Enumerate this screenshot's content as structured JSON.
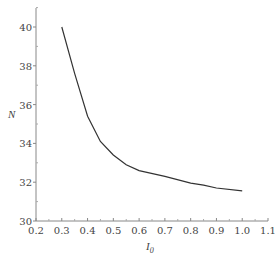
{
  "chart_data": {
    "type": "line",
    "title": "",
    "xlabel": "I0",
    "xlabel_main": "I",
    "xlabel_sub": "0",
    "ylabel": "N",
    "xlim": [
      0.2,
      1.1
    ],
    "ylim": [
      30,
      41
    ],
    "x_ticks": [
      "0.2",
      "0.3",
      "0.4",
      "0.5",
      "0.6",
      "0.7",
      "0.8",
      "0.9",
      "1.0",
      "1.1"
    ],
    "y_ticks": [
      "30",
      "32",
      "34",
      "36",
      "38",
      "40"
    ],
    "grid": false,
    "legend": null,
    "series": [
      {
        "name": "N vs I0",
        "x": [
          0.3,
          0.35,
          0.4,
          0.45,
          0.5,
          0.55,
          0.6,
          0.7,
          0.8,
          0.85,
          0.9,
          1.0
        ],
        "values": [
          40.0,
          37.6,
          35.4,
          34.1,
          33.4,
          32.9,
          32.6,
          32.3,
          31.95,
          31.85,
          31.7,
          31.55
        ]
      }
    ]
  },
  "colors": {
    "line": "#333333",
    "axis": "#888888",
    "text": "#444444"
  }
}
